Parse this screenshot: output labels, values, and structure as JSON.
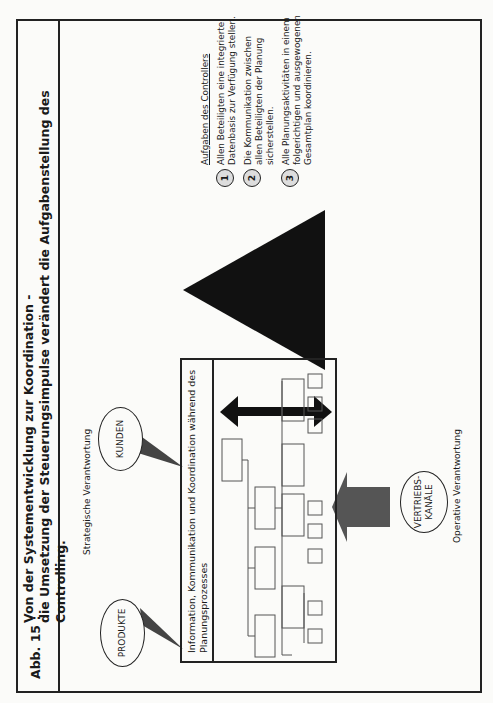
{
  "figure": {
    "label": "Abb. 15 :",
    "title_line1": "Von der Systementwicklung zur Koordination -",
    "title_line2": "die Umsetzung der Steuerungsimpulse verändert die Aufgabenstellung des Controlling."
  },
  "diagram": {
    "strategic_label": "Strategische Verantwortung",
    "operative_label": "Operative Verantwortung",
    "ovals": {
      "produkte": "PRODUKTE",
      "kunden": "KUNDEN",
      "vertrieb_line1": "VERTRIEBS-",
      "vertrieb_line2": "KANÄLE"
    },
    "box_header": "Information, Kommunikation und Koordination während des Planungsprozesses"
  },
  "tasks": {
    "header": "Aufgaben des Controllers",
    "items": [
      {
        "num": "1",
        "text": "Allen Beteiligten eine integrierte Datenbasis zur Verfügung stellen."
      },
      {
        "num": "2",
        "text": "Die Kommunikation zwischen allen Beteiligten der Planung sicherstellen."
      },
      {
        "num": "3",
        "text": "Alle Planungsaktivitäten in einem folgerichtigen und ausgewogenen Gesamtplan koordinieren."
      }
    ]
  }
}
